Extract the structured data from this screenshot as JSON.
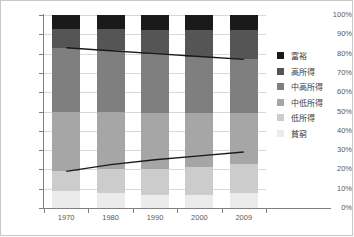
{
  "chart_data": {
    "type": "bar",
    "title": "",
    "xlabel": "",
    "ylabel": "",
    "stacked": true,
    "normalized_percent": true,
    "grid": true,
    "legend_position": "right",
    "categories": [
      "1970",
      "1980",
      "1990",
      "2000",
      "2009"
    ],
    "ylim": [
      0,
      100
    ],
    "ytick_labels": [
      "0%",
      "10%",
      "20%",
      "30%",
      "40%",
      "50%",
      "60%",
      "70%",
      "80%",
      "90%",
      "100%"
    ],
    "ytick_values": [
      0,
      10,
      20,
      30,
      40,
      50,
      60,
      70,
      80,
      90,
      100
    ],
    "series": [
      {
        "name": "富裕",
        "color": "#1a1a1a",
        "values": [
          7,
          7,
          8,
          8,
          8
        ]
      },
      {
        "name": "高所得",
        "color": "#555555",
        "values": [
          10,
          11,
          12,
          14,
          15
        ]
      },
      {
        "name": "中高所得",
        "color": "#7f7f7f",
        "values": [
          33,
          32,
          31,
          29,
          28
        ]
      },
      {
        "name": "中低所得",
        "color": "#a6a6a6",
        "values": [
          31,
          30,
          29,
          28,
          26
        ]
      },
      {
        "name": "低所得",
        "color": "#cccccc",
        "values": [
          10,
          12,
          13,
          14,
          15
        ]
      },
      {
        "name": "貧窮",
        "color": "#ebebeb",
        "values": [
          9,
          8,
          7,
          7,
          8
        ]
      }
    ],
    "trend_lines": [
      {
        "name": "upper-trend",
        "color": "#1a1a1a",
        "values": [
          83,
          81.5,
          80,
          78.5,
          77
        ]
      },
      {
        "name": "lower-trend",
        "color": "#1a1a1a",
        "values": [
          19,
          22.5,
          25,
          27,
          29
        ]
      }
    ]
  },
  "legend": {
    "items": [
      {
        "label": "富裕",
        "color": "#1a1a1a"
      },
      {
        "label": "高所得",
        "color": "#555555"
      },
      {
        "label": "中高所得",
        "color": "#7f7f7f"
      },
      {
        "label": "中低所得",
        "color": "#a6a6a6"
      },
      {
        "label": "低所得",
        "color": "#cccccc"
      },
      {
        "label": "貧窮",
        "color": "#ebebeb"
      }
    ]
  }
}
